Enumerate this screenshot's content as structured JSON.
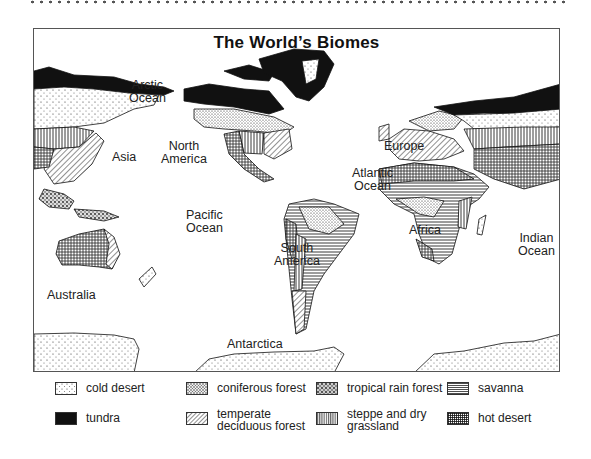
{
  "title": "The World’s Biomes",
  "labels": {
    "arctic_ocean": "Arctic\nOcean",
    "asia": "Asia",
    "north_america": "North\nAmerica",
    "europe": "Europe",
    "atlantic_ocean": "Atlantic\nOcean",
    "pacific_ocean": "Pacific\nOcean",
    "africa": "Africa",
    "indian_ocean": "Indian\nOcean",
    "south_america": "South\nAmerica",
    "australia": "Australia",
    "antarctica": "Antarctica"
  },
  "legend": [
    {
      "id": "cold-desert",
      "label": "cold desert",
      "pattern": "sparse-dots"
    },
    {
      "id": "coniferous-forest",
      "label": "coniferous forest",
      "pattern": "dense-stipple"
    },
    {
      "id": "tropical-rain-forest",
      "label": "tropical rain forest",
      "pattern": "coarse-stipple"
    },
    {
      "id": "savanna",
      "label": "savanna",
      "pattern": "horizontal-lines"
    },
    {
      "id": "tundra",
      "label": "tundra",
      "pattern": "solid-black"
    },
    {
      "id": "temperate-deciduous-forest",
      "label": "temperate\ndeciduous forest",
      "pattern": "diagonal-lines"
    },
    {
      "id": "steppe-and-dry-grassland",
      "label": "steppe and dry\ngrassland",
      "pattern": "vertical-lines"
    },
    {
      "id": "hot-desert",
      "label": "hot desert",
      "pattern": "crosshatch"
    }
  ]
}
